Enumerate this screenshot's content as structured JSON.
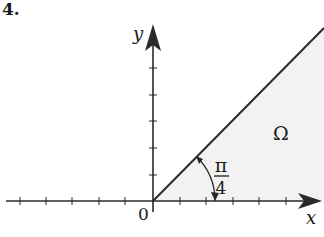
{
  "problem_number": "4.",
  "axes": {
    "x_label": "x",
    "y_label": "y",
    "origin_label": "0",
    "x_ticks_negative": 5,
    "x_ticks_positive": 5,
    "y_ticks_positive": 5
  },
  "region": {
    "label": "Ω",
    "angle_numerator": "π",
    "angle_denominator": "4",
    "description": "Sector between positive x-axis and line y = x"
  },
  "colors": {
    "line": "#2a2a2a",
    "region_fill": "#f2f2f2",
    "background": "#ffffff"
  }
}
